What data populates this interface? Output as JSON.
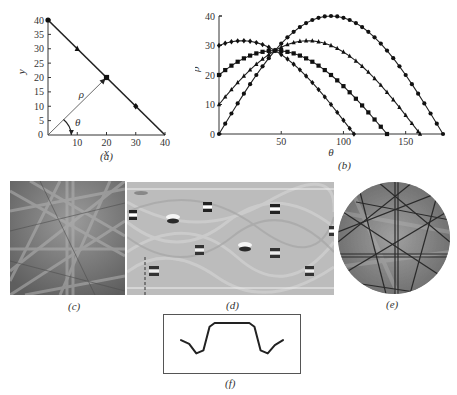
{
  "figure": {
    "panels": [
      {
        "id": "a",
        "caption": "(a)"
      },
      {
        "id": "b",
        "caption": "(b)"
      },
      {
        "id": "c",
        "caption": "(c)"
      },
      {
        "id": "d",
        "caption": "(d)"
      },
      {
        "id": "e",
        "caption": "(e)"
      },
      {
        "id": "f",
        "caption": "(f)"
      }
    ]
  },
  "chart_data": [
    {
      "panel": "a",
      "type": "line",
      "title": "",
      "xlabel": "x",
      "ylabel": "y",
      "xlim": [
        0,
        40
      ],
      "ylim": [
        0,
        40
      ],
      "xticks": [
        10,
        20,
        30,
        40
      ],
      "yticks": [
        0,
        5,
        10,
        15,
        20,
        25,
        30,
        35,
        40
      ],
      "x_origin_label": "0",
      "grid": false,
      "series": [
        {
          "name": "line",
          "x": [
            0,
            40
          ],
          "y": [
            40,
            0
          ]
        },
        {
          "name": "points",
          "markers": [
            "circle",
            "triangle",
            "square",
            "diamond"
          ],
          "x": [
            0,
            10,
            20,
            30
          ],
          "y": [
            40,
            30,
            20,
            10
          ]
        }
      ],
      "annotations": [
        {
          "text": "ρ",
          "description": "normal vector from origin to (20,20)"
        },
        {
          "text": "θ",
          "description": "angle of normal vector with x axis"
        }
      ]
    },
    {
      "panel": "b",
      "type": "line",
      "title": "",
      "xlabel": "θ",
      "ylabel": "ρ",
      "xlim": [
        0,
        180
      ],
      "ylim": [
        0,
        40
      ],
      "xticks": [
        50,
        100,
        150
      ],
      "yticks": [
        0,
        10,
        20,
        30,
        40
      ],
      "grid": false,
      "formula": "ρ = x·cosθ + y·sinθ",
      "step_deg": 5,
      "series": [
        {
          "name": "point (0,40)",
          "px": 0,
          "py": 40,
          "marker": "circle"
        },
        {
          "name": "point (10,30)",
          "px": 10,
          "py": 30,
          "marker": "triangle"
        },
        {
          "name": "point (20,20)",
          "px": 20,
          "py": 20,
          "marker": "square"
        },
        {
          "name": "point (30,10)",
          "px": 30,
          "py": 10,
          "marker": "diamond"
        }
      ],
      "intersection": {
        "theta": 45,
        "rho": 28.3
      }
    },
    {
      "panel": "f",
      "type": "line",
      "description": "band intensity profile: low wings, dips, high flat plateau",
      "points": [
        [
          0,
          0.55
        ],
        [
          0.08,
          0.45
        ],
        [
          0.15,
          0.2
        ],
        [
          0.22,
          0.28
        ],
        [
          0.28,
          0.9
        ],
        [
          0.33,
          1.0
        ],
        [
          0.67,
          1.0
        ],
        [
          0.72,
          0.9
        ],
        [
          0.78,
          0.28
        ],
        [
          0.85,
          0.2
        ],
        [
          0.92,
          0.42
        ],
        [
          1,
          0.55
        ]
      ]
    }
  ]
}
